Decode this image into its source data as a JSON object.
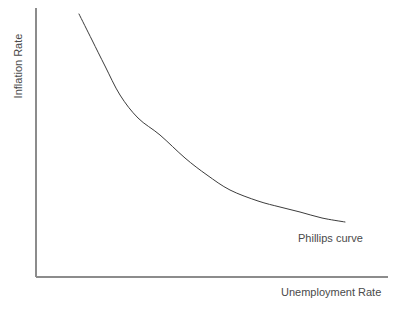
{
  "chart_data": {
    "type": "line",
    "title": "",
    "title_note": "clipped-above-top-edge-illegible",
    "xlabel": "Unemployment Rate",
    "ylabel": "Inflation Rate",
    "grid": false,
    "ticks": false,
    "legend": "none",
    "annotations": [
      {
        "text": "Phillips curve",
        "x": 298,
        "y": 239
      }
    ],
    "series": [
      {
        "name": "Phillips curve",
        "description": "Downward-sloping convex curve: inverse relationship between unemployment and inflation",
        "points": [
          {
            "x": 79,
            "y": 14
          },
          {
            "x": 92,
            "y": 40
          },
          {
            "x": 105,
            "y": 66
          },
          {
            "x": 120,
            "y": 95
          },
          {
            "x": 138,
            "y": 118
          },
          {
            "x": 160,
            "y": 135
          },
          {
            "x": 185,
            "y": 158
          },
          {
            "x": 207,
            "y": 175
          },
          {
            "x": 230,
            "y": 190
          },
          {
            "x": 258,
            "y": 201
          },
          {
            "x": 280,
            "y": 207
          },
          {
            "x": 300,
            "y": 212
          },
          {
            "x": 322,
            "y": 218
          },
          {
            "x": 345,
            "y": 222
          }
        ]
      }
    ],
    "axes": {
      "x_axis_y": 277,
      "x_axis_from": 36,
      "x_axis_to": 388,
      "y_axis_x": 36,
      "y_axis_from": 8,
      "y_axis_to": 277
    },
    "colors": {
      "background": "#ffffff",
      "axis": "#8c8c8c",
      "curve": "#3c3c3c",
      "label": "#4a4a4a"
    }
  }
}
